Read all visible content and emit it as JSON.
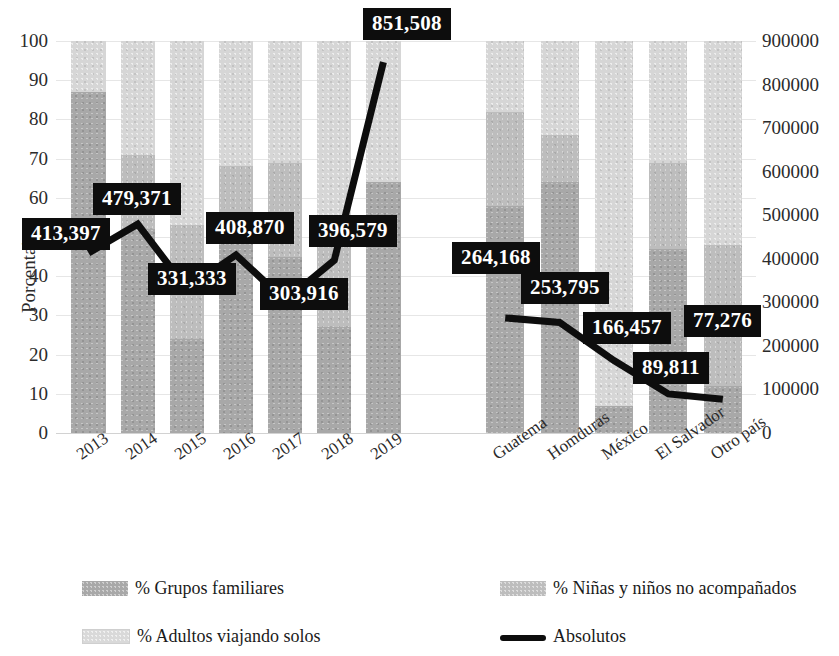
{
  "chart_data": {
    "type": "bar",
    "title": "",
    "subtitle": "",
    "xlabel": "",
    "ylabel": "Porcentaje",
    "y2label": "",
    "ylim": [
      0,
      100
    ],
    "y2lim": [
      0,
      900000
    ],
    "grid": true,
    "legend_position": "bottom",
    "stacked": true,
    "secondary_axis_series": "Absolutos",
    "groups": [
      {
        "name": "Años",
        "categories": [
          "2013",
          "2014",
          "2015",
          "2016",
          "2017",
          "2018",
          "2019"
        ],
        "series": [
          {
            "name": "% Grupos familiares",
            "values": [
              87,
              52,
              24,
              51,
              45,
              27,
              64
            ]
          },
          {
            "name": "% Niñas y niños no acompañados",
            "values": [
              0,
              19,
              29,
              17,
              24,
              21,
              0
            ]
          },
          {
            "name": "% Adultos viajando solos",
            "values": [
              13,
              29,
              47,
              32,
              31,
              52,
              36
            ]
          }
        ],
        "absolutos": [
          413397,
          479371,
          331333,
          408870,
          303916,
          396579,
          851508
        ]
      },
      {
        "name": "Países",
        "categories": [
          "Guatema",
          "Homduras",
          "México",
          "El Salvador",
          "Otro país"
        ],
        "series": [
          {
            "name": "% Grupos familiares",
            "values": [
              58,
              64,
              7,
              47,
              12
            ]
          },
          {
            "name": "% Niñas y niños no acompañados",
            "values": [
              24,
              12,
              0,
              22,
              36
            ]
          },
          {
            "name": "% Adultos viajando solos",
            "values": [
              18,
              24,
              93,
              31,
              52
            ]
          }
        ],
        "absolutos": [
          264168,
          253795,
          166457,
          89811,
          77276
        ]
      }
    ],
    "y_ticks_left": [
      "100",
      "90",
      "80",
      "70",
      "60",
      "50",
      "40",
      "30",
      "20",
      "10",
      "0"
    ],
    "y_ticks_right": [
      "900000",
      "800000",
      "700000",
      "600000",
      "500000",
      "400000",
      "300000",
      "200000",
      "100000",
      "0"
    ],
    "data_labels": [
      "413,397",
      "479,371",
      "331,333",
      "408,870",
      "303,916",
      "396,579",
      "851,508",
      "264,168",
      "253,795",
      "166,457",
      "89,811",
      "77,276"
    ],
    "legend": [
      {
        "key": "fam",
        "label": "% Grupos familiares"
      },
      {
        "key": "nin",
        "label": "% Niñas y niños no acompañados"
      },
      {
        "key": "adu",
        "label": "% Adultos viajando solos"
      },
      {
        "key": "line",
        "label": "Absolutos"
      }
    ],
    "colors": {
      "grupos_familiares": "#a8a8a8",
      "ninas_ninos": "#bdbdbd",
      "adultos_solos": "#d6d6d6",
      "absolutos_line": "#0d0d0d",
      "label_box": "#0d0d0d",
      "label_text": "#ffffff",
      "gridline": "#e6e6e6"
    }
  }
}
